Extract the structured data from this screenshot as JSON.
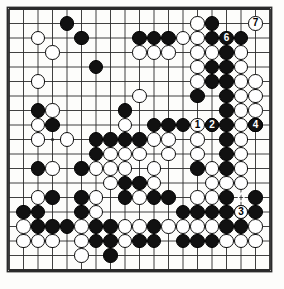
{
  "diagram": {
    "kind": "go-board-problem-diagram",
    "board_size": 19,
    "title": "",
    "background_color": "#fdfdfb",
    "line_color": "#2b2b2b",
    "black_color": "#111111",
    "white_color": "#ffffff",
    "geometry": {
      "origin_x": 9,
      "origin_y": 9,
      "spacing": 14.5,
      "stone_radius": 7.2,
      "border_px": 2
    },
    "star_points": [
      {
        "col": 4,
        "row": 4
      },
      {
        "col": 10,
        "row": 4
      },
      {
        "col": 16,
        "row": 4
      },
      {
        "col": 4,
        "row": 10
      },
      {
        "col": 10,
        "row": 10
      },
      {
        "col": 16,
        "row": 10
      },
      {
        "col": 4,
        "row": 16
      },
      {
        "col": 10,
        "row": 16
      },
      {
        "col": 16,
        "row": 16
      }
    ],
    "black_stones": [
      {
        "col": 5,
        "row": 2
      },
      {
        "col": 15,
        "row": 2
      },
      {
        "col": 6,
        "row": 3
      },
      {
        "col": 10,
        "row": 3
      },
      {
        "col": 11,
        "row": 3
      },
      {
        "col": 12,
        "row": 3
      },
      {
        "col": 15,
        "row": 3
      },
      {
        "col": 17,
        "row": 3
      },
      {
        "col": 16,
        "row": 4
      },
      {
        "col": 7,
        "row": 5
      },
      {
        "col": 15,
        "row": 5
      },
      {
        "col": 16,
        "row": 5
      },
      {
        "col": 15,
        "row": 6
      },
      {
        "col": 16,
        "row": 6
      },
      {
        "col": 14,
        "row": 7
      },
      {
        "col": 16,
        "row": 7
      },
      {
        "col": 3,
        "row": 8
      },
      {
        "col": 9,
        "row": 8
      },
      {
        "col": 16,
        "row": 8
      },
      {
        "col": 4,
        "row": 9
      },
      {
        "col": 11,
        "row": 9
      },
      {
        "col": 12,
        "row": 9
      },
      {
        "col": 13,
        "row": 9
      },
      {
        "col": 16,
        "row": 9
      },
      {
        "col": 18,
        "row": 9
      },
      {
        "col": 7,
        "row": 10
      },
      {
        "col": 8,
        "row": 10
      },
      {
        "col": 9,
        "row": 10
      },
      {
        "col": 10,
        "row": 10
      },
      {
        "col": 16,
        "row": 10
      },
      {
        "col": 7,
        "row": 11
      },
      {
        "col": 16,
        "row": 11
      },
      {
        "col": 3,
        "row": 12
      },
      {
        "col": 6,
        "row": 12
      },
      {
        "col": 14,
        "row": 12
      },
      {
        "col": 16,
        "row": 12
      },
      {
        "col": 9,
        "row": 13
      },
      {
        "col": 10,
        "row": 13
      },
      {
        "col": 4,
        "row": 14
      },
      {
        "col": 6,
        "row": 14
      },
      {
        "col": 9,
        "row": 14
      },
      {
        "col": 11,
        "row": 14
      },
      {
        "col": 12,
        "row": 14
      },
      {
        "col": 16,
        "row": 14
      },
      {
        "col": 18,
        "row": 14
      },
      {
        "col": 2,
        "row": 15
      },
      {
        "col": 3,
        "row": 15
      },
      {
        "col": 6,
        "row": 15
      },
      {
        "col": 13,
        "row": 15
      },
      {
        "col": 14,
        "row": 15
      },
      {
        "col": 15,
        "row": 15
      },
      {
        "col": 16,
        "row": 15
      },
      {
        "col": 17,
        "row": 15
      },
      {
        "col": 18,
        "row": 15
      },
      {
        "col": 3,
        "row": 16
      },
      {
        "col": 4,
        "row": 16
      },
      {
        "col": 5,
        "row": 16
      },
      {
        "col": 7,
        "row": 16
      },
      {
        "col": 8,
        "row": 16
      },
      {
        "col": 11,
        "row": 16
      },
      {
        "col": 16,
        "row": 16
      },
      {
        "col": 17,
        "row": 16
      },
      {
        "col": 7,
        "row": 17
      },
      {
        "col": 8,
        "row": 17
      },
      {
        "col": 10,
        "row": 17
      },
      {
        "col": 11,
        "row": 17
      },
      {
        "col": 13,
        "row": 17
      },
      {
        "col": 14,
        "row": 17
      },
      {
        "col": 15,
        "row": 17
      },
      {
        "col": 8,
        "row": 18
      }
    ],
    "white_stones": [
      {
        "col": 14,
        "row": 2
      },
      {
        "col": 3,
        "row": 3
      },
      {
        "col": 13,
        "row": 3
      },
      {
        "col": 14,
        "row": 3
      },
      {
        "col": 4,
        "row": 4
      },
      {
        "col": 10,
        "row": 4
      },
      {
        "col": 11,
        "row": 4
      },
      {
        "col": 12,
        "row": 4
      },
      {
        "col": 14,
        "row": 4
      },
      {
        "col": 15,
        "row": 4
      },
      {
        "col": 17,
        "row": 4
      },
      {
        "col": 14,
        "row": 5
      },
      {
        "col": 17,
        "row": 5
      },
      {
        "col": 3,
        "row": 6
      },
      {
        "col": 14,
        "row": 6
      },
      {
        "col": 17,
        "row": 6
      },
      {
        "col": 18,
        "row": 6
      },
      {
        "col": 10,
        "row": 7
      },
      {
        "col": 17,
        "row": 7
      },
      {
        "col": 18,
        "row": 7
      },
      {
        "col": 4,
        "row": 8
      },
      {
        "col": 17,
        "row": 8
      },
      {
        "col": 18,
        "row": 8
      },
      {
        "col": 3,
        "row": 9
      },
      {
        "col": 9,
        "row": 9
      },
      {
        "col": 15,
        "row": 9
      },
      {
        "col": 17,
        "row": 9
      },
      {
        "col": 3,
        "row": 10
      },
      {
        "col": 5,
        "row": 10
      },
      {
        "col": 11,
        "row": 10
      },
      {
        "col": 12,
        "row": 10
      },
      {
        "col": 14,
        "row": 10
      },
      {
        "col": 17,
        "row": 10
      },
      {
        "col": 8,
        "row": 11
      },
      {
        "col": 9,
        "row": 11
      },
      {
        "col": 10,
        "row": 11
      },
      {
        "col": 12,
        "row": 11
      },
      {
        "col": 14,
        "row": 11
      },
      {
        "col": 17,
        "row": 11
      },
      {
        "col": 4,
        "row": 12
      },
      {
        "col": 7,
        "row": 12
      },
      {
        "col": 8,
        "row": 12
      },
      {
        "col": 9,
        "row": 12
      },
      {
        "col": 11,
        "row": 12
      },
      {
        "col": 15,
        "row": 12
      },
      {
        "col": 17,
        "row": 12
      },
      {
        "col": 8,
        "row": 13
      },
      {
        "col": 11,
        "row": 13
      },
      {
        "col": 15,
        "row": 13
      },
      {
        "col": 16,
        "row": 13
      },
      {
        "col": 17,
        "row": 13
      },
      {
        "col": 3,
        "row": 14
      },
      {
        "col": 7,
        "row": 14
      },
      {
        "col": 10,
        "row": 14
      },
      {
        "col": 14,
        "row": 14
      },
      {
        "col": 15,
        "row": 14
      },
      {
        "col": 7,
        "row": 15
      },
      {
        "col": 2,
        "row": 16
      },
      {
        "col": 6,
        "row": 16
      },
      {
        "col": 9,
        "row": 16
      },
      {
        "col": 10,
        "row": 16
      },
      {
        "col": 12,
        "row": 16
      },
      {
        "col": 13,
        "row": 16
      },
      {
        "col": 14,
        "row": 16
      },
      {
        "col": 15,
        "row": 16
      },
      {
        "col": 18,
        "row": 16
      },
      {
        "col": 2,
        "row": 17
      },
      {
        "col": 3,
        "row": 17
      },
      {
        "col": 4,
        "row": 17
      },
      {
        "col": 6,
        "row": 17
      },
      {
        "col": 9,
        "row": 17
      },
      {
        "col": 16,
        "row": 17
      },
      {
        "col": 17,
        "row": 17
      },
      {
        "col": 18,
        "row": 17
      },
      {
        "col": 6,
        "row": 18
      }
    ],
    "numbered_moves": [
      {
        "label": "1",
        "col": 14,
        "row": 9,
        "color": "white",
        "text_on": "onwhite"
      },
      {
        "label": "2",
        "col": 15,
        "row": 9,
        "color": "black",
        "text_on": "onblack"
      },
      {
        "label": "3",
        "col": 17,
        "row": 15,
        "color": "white",
        "text_on": "onwhite"
      },
      {
        "label": "4",
        "col": 18,
        "row": 9,
        "color": "black",
        "text_on": "onblack"
      },
      {
        "label": "6",
        "col": 16,
        "row": 3,
        "color": "black",
        "text_on": "onblack"
      },
      {
        "label": "7",
        "col": 18,
        "row": 2,
        "color": "white",
        "text_on": "onwhite"
      }
    ],
    "triangle_marks": [
      {
        "col": 17,
        "row": 14,
        "on_color": "black",
        "marker": "triangle-up"
      }
    ],
    "legend": {
      "move_numbers": [
        "1",
        "2",
        "3",
        "4",
        "6",
        "7"
      ],
      "marker_note": "triangle"
    }
  }
}
